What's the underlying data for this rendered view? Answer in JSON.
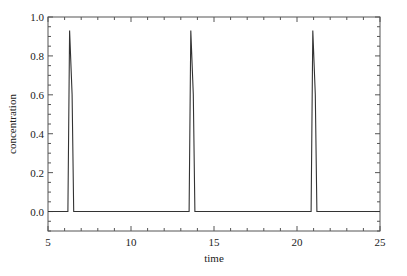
{
  "chart_data": {
    "type": "line",
    "title": "",
    "xlabel": "time",
    "ylabel": "concentration",
    "xlim": [
      5,
      25
    ],
    "ylim": [
      -0.1,
      1.0
    ],
    "grid": false,
    "legend": null,
    "x_ticks": [
      5,
      10,
      15,
      20,
      25
    ],
    "x_tick_labels": [
      "5",
      "10",
      "15",
      "20",
      "25"
    ],
    "y_ticks": [
      0.0,
      0.2,
      0.4,
      0.6,
      0.8,
      1.0
    ],
    "y_tick_labels": [
      "0.0",
      "0.2",
      "0.4",
      "0.6",
      "0.8",
      "1.0"
    ],
    "series": [
      {
        "name": "concentration",
        "color": "#333333",
        "x": [
          5.0,
          6.2,
          6.3,
          6.45,
          6.55,
          13.5,
          13.6,
          13.75,
          13.85,
          20.85,
          20.95,
          21.1,
          21.2,
          25.0
        ],
        "y": [
          0.0,
          0.0,
          0.93,
          0.6,
          0.0,
          0.0,
          0.93,
          0.6,
          0.0,
          0.0,
          0.93,
          0.6,
          0.0,
          0.0
        ]
      }
    ],
    "peaks": [
      {
        "t": 6.3,
        "value": 0.93
      },
      {
        "t": 13.6,
        "value": 0.93
      },
      {
        "t": 20.95,
        "value": 0.93
      }
    ]
  }
}
